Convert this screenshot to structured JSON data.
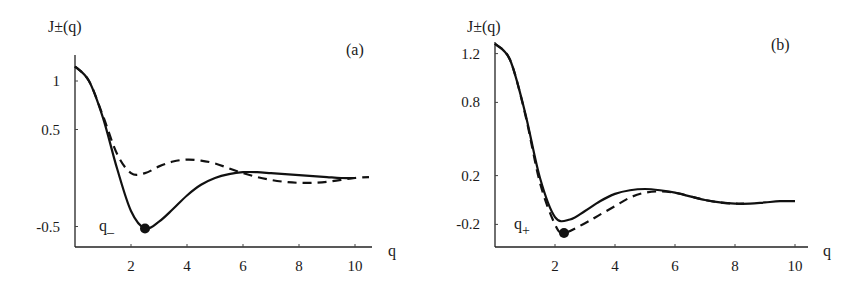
{
  "chart_data": [
    {
      "type": "line",
      "panel_label": "(a)",
      "ylabel": "J±(q)",
      "xlabel": "q",
      "xticks": [
        "2",
        "4",
        "6",
        "8",
        "10"
      ],
      "yticks": [
        "1",
        "0.5",
        "-0.5"
      ],
      "xlim": [
        0,
        11
      ],
      "ylim": [
        -0.7,
        1.25
      ],
      "grid": false,
      "annotation": {
        "text": "q_",
        "marker_at": [
          2.5,
          -0.52
        ]
      },
      "series": [
        {
          "name": "solid",
          "style": "solid",
          "x": [
            0,
            0.5,
            1,
            1.5,
            2,
            2.5,
            3,
            3.5,
            4,
            4.5,
            5,
            5.5,
            6,
            6.5,
            7,
            7.5,
            8,
            8.5,
            9,
            9.5,
            10
          ],
          "y": [
            1.15,
            1.0,
            0.62,
            0.1,
            -0.34,
            -0.52,
            -0.45,
            -0.32,
            -0.18,
            -0.07,
            0.0,
            0.04,
            0.06,
            0.06,
            0.05,
            0.04,
            0.03,
            0.02,
            0.01,
            0.0,
            0.0
          ]
        },
        {
          "name": "dashed",
          "style": "dashed",
          "x": [
            0,
            0.5,
            1,
            1.5,
            2,
            2.5,
            3,
            3.5,
            4,
            4.5,
            5,
            5.5,
            6,
            6.5,
            7,
            7.5,
            8,
            8.5,
            9,
            9.5,
            10,
            10.5
          ],
          "y": [
            1.15,
            1.0,
            0.64,
            0.25,
            0.05,
            0.05,
            0.12,
            0.17,
            0.19,
            0.18,
            0.15,
            0.1,
            0.05,
            0.01,
            -0.02,
            -0.04,
            -0.05,
            -0.05,
            -0.04,
            -0.02,
            0.0,
            0.01
          ]
        }
      ]
    },
    {
      "type": "line",
      "panel_label": "(b)",
      "ylabel": "J±(q)",
      "xlabel": "q",
      "xticks": [
        "2",
        "4",
        "6",
        "8",
        "10"
      ],
      "yticks": [
        "1.2",
        "0.8",
        "0.2",
        "-0.2"
      ],
      "xlim": [
        0,
        11
      ],
      "ylim": [
        -0.38,
        1.35
      ],
      "grid": false,
      "annotation": {
        "text": "q+",
        "marker_at": [
          2.3,
          -0.27
        ]
      },
      "series": [
        {
          "name": "solid",
          "style": "solid",
          "x": [
            0,
            0.5,
            1,
            1.5,
            2,
            2.5,
            3,
            3.5,
            4,
            4.5,
            5,
            5.5,
            6,
            6.5,
            7,
            7.5,
            8,
            8.5,
            9,
            9.5,
            10
          ],
          "y": [
            1.28,
            1.15,
            0.72,
            0.18,
            -0.14,
            -0.16,
            -0.09,
            -0.01,
            0.05,
            0.08,
            0.09,
            0.08,
            0.06,
            0.03,
            0.0,
            -0.02,
            -0.03,
            -0.03,
            -0.02,
            -0.01,
            -0.01
          ]
        },
        {
          "name": "dashed",
          "style": "dashed",
          "x": [
            0,
            0.5,
            1,
            1.5,
            2,
            2.3,
            3,
            3.5,
            4,
            4.5,
            5,
            5.5,
            6,
            6.5,
            7,
            7.5,
            8,
            8.3
          ],
          "y": [
            1.28,
            1.15,
            0.71,
            0.14,
            -0.2,
            -0.27,
            -0.19,
            -0.12,
            -0.05,
            0.02,
            0.06,
            0.07,
            0.06,
            0.03,
            0.0,
            -0.02,
            -0.03,
            -0.03
          ]
        }
      ]
    }
  ]
}
